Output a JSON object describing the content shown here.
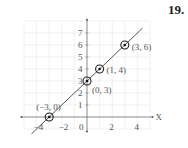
{
  "problem_number": "19.",
  "chart_data": {
    "type": "line",
    "title": "",
    "xlabel": "X",
    "ylabel": "Y",
    "xlim": [
      -5,
      5
    ],
    "ylim": [
      -1,
      8
    ],
    "grid": true,
    "x_ticks": [
      -4,
      -2,
      0,
      2,
      4
    ],
    "y_ticks": [
      1,
      2,
      3,
      4,
      5,
      6,
      7
    ],
    "series": [
      {
        "name": "line",
        "equation": "y = x + 3",
        "points": [
          {
            "x": -3,
            "y": 0,
            "label": "(−3, 0)"
          },
          {
            "x": 0,
            "y": 3,
            "label": "(0, 3)"
          },
          {
            "x": 1,
            "y": 4,
            "label": "(1, 4)"
          },
          {
            "x": 3,
            "y": 6,
            "label": "(3, 6)"
          }
        ]
      }
    ]
  }
}
